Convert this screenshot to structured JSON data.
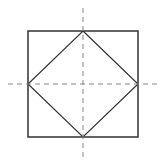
{
  "diagram": {
    "width": 165,
    "height": 166,
    "background": "#ffffff",
    "stroke_color": "#333333",
    "dash_color": "#888888",
    "outer_square": {
      "x": 28,
      "y": 31,
      "width": 110,
      "height": 106
    },
    "inner_diamond": {
      "points": [
        [
          83,
          31
        ],
        [
          138,
          84
        ],
        [
          83,
          137
        ],
        [
          28,
          84
        ]
      ]
    },
    "vertical_axis": {
      "x": 83,
      "y1": 8,
      "y2": 157
    },
    "horizontal_axis": {
      "y": 84,
      "x1": 8,
      "x2": 158
    }
  }
}
